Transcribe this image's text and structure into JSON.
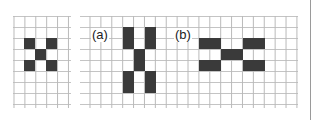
{
  "figure": {
    "panels": [
      {
        "id": "reference",
        "label": "",
        "grid": {
          "x": 16,
          "y": 16,
          "width": 56,
          "height": 92,
          "cell_size": 11
        },
        "pattern_rows": [
          "X.X",
          ".X.",
          "X.X"
        ],
        "origin": {
          "x": 24,
          "y": 38
        }
      },
      {
        "id": "a",
        "label": "(a)",
        "pattern_rows": [
          "X.X",
          "X.X",
          ".X.",
          ".X.",
          "X.X",
          "X.X"
        ],
        "origin": {
          "x": 123,
          "y": 27
        }
      },
      {
        "id": "b",
        "label": "(b)",
        "pattern_rows": [
          "XX..XX",
          "..XX..",
          "XX..XX"
        ],
        "origin": {
          "x": 199,
          "y": 38
        }
      }
    ],
    "colors": {
      "cell": "#3a3a3a",
      "grid_line": "#bdbdbd",
      "background": "#ffffff",
      "border": "#9a9a9a"
    }
  }
}
